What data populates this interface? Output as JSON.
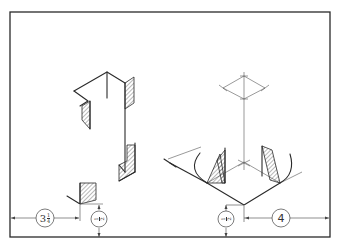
{
  "diagram": {
    "type": "isometric-construction-drawing",
    "border_color": "#2a2a2a",
    "dimensions": {
      "left_horizontal": {
        "value": "3¼",
        "whole": "3",
        "frac_num": "1",
        "frac_den": "4"
      },
      "right_horizontal": {
        "value": "4"
      },
      "left_vertical": {
        "value": "½",
        "frac_num": "1",
        "frac_den": "2"
      },
      "right_vertical": {
        "value": "½",
        "frac_num": "1",
        "frac_den": "2"
      }
    },
    "figures": [
      {
        "name": "left-figure",
        "description": "Isometric corner construction with hatched sections"
      },
      {
        "name": "right-figure",
        "description": "Isometric construction with center axis, rhombus, arcs and hatched wedges"
      }
    ]
  }
}
